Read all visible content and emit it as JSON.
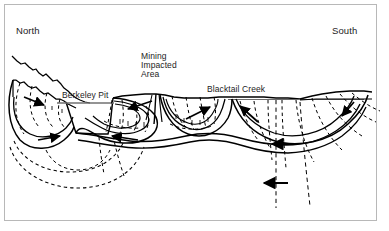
{
  "figure": {
    "orientation": "North (left) to South (right)",
    "border_color": "#b8b8b8",
    "line_color": "#000000",
    "background_color": "#ffffff"
  },
  "labels": {
    "north": "North",
    "south": "South",
    "berkeley_pit": "Berkeley Pit",
    "mining_impacted_area_line1": "Mining",
    "mining_impacted_area_line2": "Impacted",
    "mining_impacted_area_line3": "Area",
    "blacktail_creek": "Blacktail Creek"
  },
  "legend_semantics": {
    "solid_curve": "groundwater flow cell boundary",
    "dashed_curve": "groundwater flow path",
    "solid_arrow": "direction of groundwater flow",
    "horizontal_line": "water table / pit water surface"
  }
}
